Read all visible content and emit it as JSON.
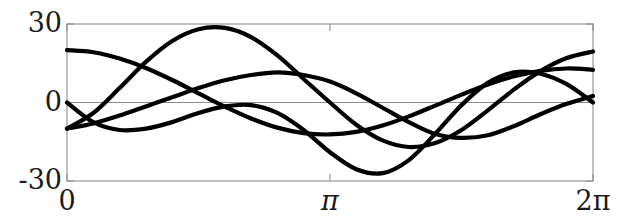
{
  "figure": {
    "background_color": "#ffffff",
    "frame_color": "#808080",
    "curve_color": "#000000",
    "zero_line_color": "#8c8c8c"
  },
  "axes": {
    "y_ticks": [
      {
        "label": "30",
        "value": 30
      },
      {
        "label": "0",
        "value": 0
      },
      {
        "label": "-30",
        "value": -30
      }
    ],
    "x_ticks": [
      {
        "label": "0",
        "value": 0
      },
      {
        "label": "π",
        "value": 3.14159
      },
      {
        "label": "2π",
        "value": 6.28319
      }
    ]
  },
  "chart_data": {
    "type": "line",
    "title": "",
    "xlabel": "",
    "ylabel": "",
    "xlim": [
      0,
      6.28319
    ],
    "ylim": [
      -30,
      30
    ],
    "grid": false,
    "legend": "none",
    "x_tick_labels": [
      "0",
      "π",
      "2π"
    ],
    "x_tick_values": [
      0,
      3.14159,
      6.28319
    ],
    "y_tick_labels": [
      "30",
      "0",
      "-30"
    ],
    "y_tick_values": [
      30,
      0,
      -30
    ],
    "series": [
      {
        "name": "curve-1",
        "color": "#000000",
        "x": [
          0.0,
          0.314,
          0.628,
          0.942,
          1.257,
          1.571,
          1.885,
          2.199,
          2.513,
          2.827,
          3.142,
          3.456,
          3.77,
          4.084,
          4.398,
          4.712,
          5.027,
          5.341,
          5.655,
          5.969,
          6.283
        ],
        "y": [
          20.0,
          19.2,
          16.8,
          13.2,
          8.6,
          3.5,
          -1.6,
          -6.1,
          -9.6,
          -11.7,
          -12.2,
          -11.2,
          -8.8,
          -5.3,
          -1.2,
          3.0,
          6.9,
          10.0,
          12.1,
          13.0,
          12.5
        ]
      },
      {
        "name": "curve-2",
        "color": "#000000",
        "x": [
          0.0,
          0.314,
          0.628,
          0.942,
          1.257,
          1.571,
          1.885,
          2.199,
          2.513,
          2.827,
          3.142,
          3.456,
          3.77,
          4.084,
          4.398,
          4.712,
          5.027,
          5.341,
          5.655,
          5.969,
          6.283
        ],
        "y": [
          -10.0,
          -4.0,
          5.5,
          15.5,
          23.5,
          28.0,
          28.5,
          25.0,
          18.0,
          9.0,
          0.0,
          -8.5,
          -14.5,
          -17.0,
          -15.5,
          -10.5,
          -3.0,
          5.0,
          12.0,
          17.0,
          19.5
        ]
      },
      {
        "name": "curve-3",
        "color": "#000000",
        "x": [
          0.0,
          0.314,
          0.628,
          0.942,
          1.257,
          1.571,
          1.885,
          2.199,
          2.513,
          2.827,
          3.142,
          3.456,
          3.77,
          4.084,
          4.398,
          4.712,
          5.027,
          5.341,
          5.655,
          5.969,
          6.283
        ],
        "y": [
          0.0,
          -7.5,
          -10.5,
          -10.0,
          -7.5,
          -4.0,
          -1.5,
          -1.0,
          -4.0,
          -10.5,
          -19.0,
          -25.5,
          -27.0,
          -22.0,
          -12.0,
          -1.0,
          7.5,
          11.5,
          11.0,
          7.0,
          0.0
        ]
      },
      {
        "name": "curve-4",
        "color": "#000000",
        "x": [
          0.0,
          0.314,
          0.628,
          0.942,
          1.257,
          1.571,
          1.885,
          2.199,
          2.513,
          2.827,
          3.142,
          3.456,
          3.77,
          4.084,
          4.398,
          4.712,
          5.027,
          5.341,
          5.655,
          5.969,
          6.283
        ],
        "y": [
          -10.0,
          -8.0,
          -5.0,
          -1.5,
          2.0,
          5.5,
          8.5,
          10.5,
          11.5,
          10.5,
          8.0,
          3.5,
          -2.0,
          -7.5,
          -12.0,
          -13.5,
          -12.5,
          -9.0,
          -4.5,
          -0.5,
          2.5
        ]
      }
    ]
  }
}
